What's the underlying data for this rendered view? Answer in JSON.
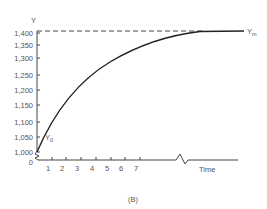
{
  "chart_data": {
    "type": "line",
    "title": "",
    "figure_label": "(B)",
    "xlabel": "Time",
    "ylabel": "Y",
    "x_ticks": [
      "1",
      "2",
      "3",
      "4",
      "5",
      "6",
      "7"
    ],
    "y_ticks": [
      "0",
      "1,000",
      "1,050",
      "1,100",
      "1,150",
      "1,200",
      "1,250",
      "1,300",
      "1,350",
      "1,400"
    ],
    "ylim": [
      1000,
      1400
    ],
    "axis_break": {
      "x_axis": true,
      "y_axis": true
    },
    "annotations": [
      {
        "label": "Y0",
        "text_main": "Y",
        "text_sub": "0",
        "at": "start of curve",
        "value": 1000
      },
      {
        "label": "Ym",
        "text_main": "Y",
        "text_sub": "m",
        "at": "asymptote",
        "value": 1400
      }
    ],
    "asymptote": {
      "value": 1400,
      "style": "dashed"
    },
    "series": [
      {
        "name": "Y",
        "description": "exponential approach from Y0 toward asymptote Ym",
        "x": [
          0,
          1,
          2,
          3,
          4,
          5,
          6,
          7,
          9,
          12
        ],
        "values": [
          1000,
          1095,
          1170,
          1230,
          1275,
          1310,
          1335,
          1355,
          1380,
          1400
        ]
      }
    ],
    "grid": false,
    "legend": "none"
  }
}
